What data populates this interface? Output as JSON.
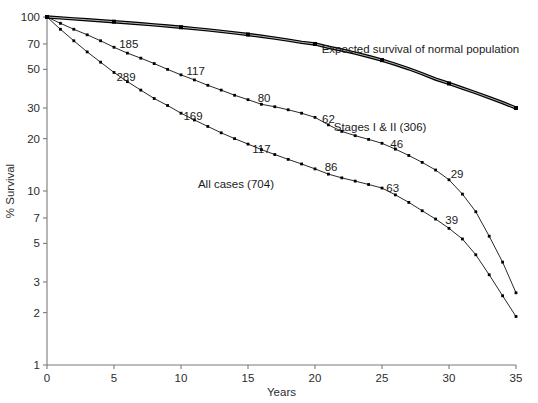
{
  "chart_data": {
    "type": "line",
    "title": "",
    "xlabel": "Years",
    "ylabel": "% Survival",
    "yscale": "log",
    "xlim": [
      0,
      35
    ],
    "ylim": [
      1,
      100
    ],
    "grid": false,
    "legend": "inline-annotations",
    "xticks": [
      0,
      5,
      10,
      15,
      20,
      25,
      30,
      35
    ],
    "xtick_labels": [
      "0",
      "5",
      "10",
      "15",
      "20",
      "25",
      "30",
      "35"
    ],
    "yticks": [
      100,
      70,
      50,
      30,
      20,
      10,
      7,
      5,
      3,
      2,
      1
    ],
    "ytick_labels": [
      "100",
      "70",
      "50",
      "30",
      "20",
      "10",
      "7",
      "5",
      "3",
      "2",
      "1"
    ],
    "series": [
      {
        "name": "Expected survival of normal population",
        "style": "thick",
        "label_text": "Expected survival of normal population",
        "label_x": 20.5,
        "label_y": 62,
        "x": [
          0,
          1,
          2,
          3,
          4,
          5,
          6,
          7,
          8,
          9,
          10,
          11,
          12,
          13,
          14,
          15,
          16,
          17,
          18,
          19,
          20,
          21,
          22,
          23,
          24,
          25,
          26,
          27,
          28,
          29,
          30,
          31,
          32,
          33,
          34,
          35
        ],
        "y": [
          100,
          98.8,
          97.6,
          96.4,
          95.2,
          94.0,
          92.7,
          91.4,
          90.1,
          88.7,
          87.3,
          85.8,
          84.3,
          82.7,
          81.0,
          79.3,
          77.5,
          75.6,
          73.6,
          71.5,
          70.0,
          67.0,
          64.6,
          62.0,
          59.3,
          56.5,
          53.5,
          50.4,
          47.2,
          44.0,
          41.5,
          39.0,
          36.7,
          34.4,
          32.2,
          30.0
        ]
      },
      {
        "name": "Stages I & II (306)",
        "style": "thin",
        "label_text": "Stages I & II (306)",
        "label_x": 21.4,
        "label_y": 22.2,
        "x": [
          0,
          1,
          2,
          3,
          4,
          5,
          6,
          7,
          8,
          9,
          10,
          11,
          12,
          13,
          14,
          15,
          16,
          17,
          18,
          19,
          20,
          21,
          22,
          23,
          24,
          25,
          26,
          27,
          28,
          29,
          30,
          31,
          32,
          33,
          34,
          35
        ],
        "y": [
          100,
          92,
          85,
          79,
          73,
          67,
          62,
          58,
          54,
          50,
          46.5,
          43.5,
          40.5,
          38,
          35.5,
          33.5,
          31.5,
          30.5,
          29.3,
          28.0,
          26.5,
          24.0,
          22.0,
          20.8,
          19.8,
          18.8,
          17.4,
          16.0,
          14.6,
          13.2,
          11.6,
          9.6,
          7.6,
          5.5,
          3.9,
          2.6
        ]
      },
      {
        "name": "All cases (704)",
        "style": "thin",
        "label_text": "All cases (704)",
        "label_x": 14.1,
        "label_y": 10.4,
        "x": [
          0,
          1,
          2,
          3,
          4,
          5,
          6,
          7,
          8,
          9,
          10,
          11,
          12,
          13,
          14,
          15,
          16,
          17,
          18,
          19,
          20,
          21,
          22,
          23,
          24,
          25,
          26,
          27,
          28,
          29,
          30,
          31,
          32,
          33,
          34,
          35
        ],
        "y": [
          100,
          85,
          73,
          63,
          55,
          48,
          42.5,
          38,
          34,
          31,
          28,
          25.6,
          23.5,
          21.6,
          20.0,
          18.6,
          17.3,
          16.2,
          15.2,
          14.3,
          13.4,
          12.5,
          11.9,
          11.4,
          10.9,
          10.4,
          9.5,
          8.6,
          7.7,
          6.9,
          6.1,
          5.3,
          4.3,
          3.3,
          2.5,
          1.9
        ]
      }
    ],
    "point_annotations": [
      {
        "text": "185",
        "x": 6.1,
        "y": 66.5,
        "series": "Stages I & II (306)"
      },
      {
        "text": "289",
        "x": 5.9,
        "y": 43.0,
        "series": "All cases (704)"
      },
      {
        "text": "117",
        "x": 11.1,
        "y": 46.5,
        "series": "Stages I & II (306)"
      },
      {
        "text": "169",
        "x": 10.9,
        "y": 25.6,
        "series": "All cases (704)"
      },
      {
        "text": "80",
        "x": 16.2,
        "y": 32.5,
        "series": "Stages I & II (306)"
      },
      {
        "text": "117",
        "x": 16.0,
        "y": 16.5,
        "series": "All cases (704)"
      },
      {
        "text": "62",
        "x": 21.0,
        "y": 24.6,
        "series": "Stages I & II (306)"
      },
      {
        "text": "86",
        "x": 21.2,
        "y": 13.0,
        "series": "All cases (704)"
      },
      {
        "text": "46",
        "x": 26.1,
        "y": 17.6,
        "series": "Stages I & II (306)"
      },
      {
        "text": "63",
        "x": 25.8,
        "y": 9.9,
        "series": "All cases (704)"
      },
      {
        "text": "29",
        "x": 30.6,
        "y": 11.8,
        "series": "Stages I & II (306)"
      },
      {
        "text": "39",
        "x": 30.2,
        "y": 6.5,
        "series": "All cases (704)"
      }
    ]
  }
}
